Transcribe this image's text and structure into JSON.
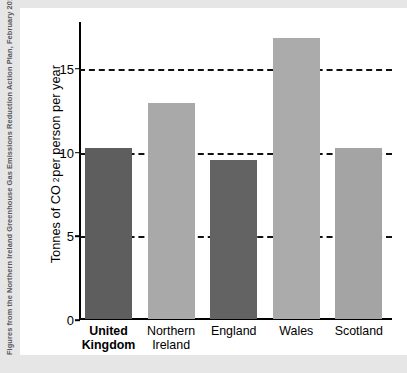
{
  "caption": {
    "text": "Figures from the Northern Ireland Greenhouse Gas Emissions Reduction Action Plan, February 2011"
  },
  "axis": {
    "y_title_part1": "Tonnes of CO",
    "y_title_sub": "2",
    "y_title_part2": " per person per year"
  },
  "chart_data": {
    "type": "bar",
    "title": "",
    "xlabel": "",
    "ylabel": "Tonnes of CO2 per person per year",
    "categories": [
      "United Kingdom",
      "Northern Ireland",
      "England",
      "Wales",
      "Scotland"
    ],
    "category_lines": [
      [
        "United",
        "Kingdom"
      ],
      [
        "Northern",
        "Ireland"
      ],
      [
        "England"
      ],
      [
        "Wales"
      ],
      [
        "Scotland"
      ]
    ],
    "values": [
      10.2,
      12.9,
      9.5,
      16.8,
      10.2
    ],
    "ylim": [
      0,
      17.8
    ],
    "yticks": [
      0,
      5,
      10,
      15
    ],
    "ytick_labels": [
      "0",
      "5",
      "10",
      "15"
    ],
    "gridlines": [
      5,
      10,
      15
    ],
    "grid": true,
    "grid_style": "dashed",
    "legend": "none",
    "highlighted_category": "United Kingdom",
    "bar_colors": [
      "#5e5e5e",
      "#a9a9a9",
      "#636363",
      "#ababab",
      "#a4a4a4"
    ],
    "colors": {
      "dark_bar": "#5e5e5e",
      "light_bar": "#a9a9a9",
      "grid": "#111111",
      "axis": "#000000",
      "panel_background": "#ffffff",
      "page_background": "#e6e6e6",
      "caption_text": "#55585c"
    }
  }
}
